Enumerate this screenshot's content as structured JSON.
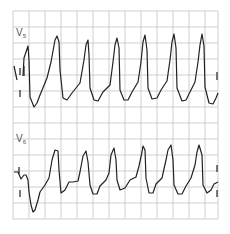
{
  "figure": {
    "type": "ECG rhythm strip",
    "grid": {
      "x0": 13,
      "y0": 11,
      "x1": 218,
      "y1": 219,
      "step": 16,
      "color": "#cfcfcf"
    },
    "trace_color": "#222222",
    "leads": [
      {
        "name": "V",
        "sub": "5",
        "label_x": 16,
        "label_y": 36
      },
      {
        "name": "V",
        "sub": "6",
        "label_x": 16,
        "label_y": 142
      }
    ]
  }
}
